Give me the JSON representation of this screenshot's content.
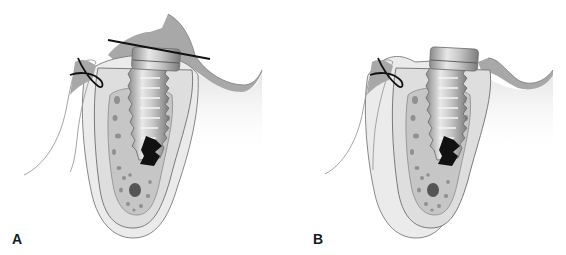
{
  "figure": {
    "panels": [
      {
        "label": "A",
        "has_reference_line": true,
        "gingiva_covers_implant": true
      },
      {
        "label": "B",
        "has_reference_line": false,
        "gingiva_covers_implant": false
      }
    ]
  },
  "colors": {
    "gingiva": "#a8a8a8",
    "soft_tissue": "#e6e6e6",
    "cortical_bone": "#dcdcdc",
    "cancellous_bone": "#c4c4c4",
    "marrow_spaces": "#8e8e8e",
    "implant_light": "#e0e0e0",
    "implant_dark": "#8c8c8c",
    "defect_black": "#111111",
    "suture": "#111111",
    "outline": "#7a7a7a"
  }
}
